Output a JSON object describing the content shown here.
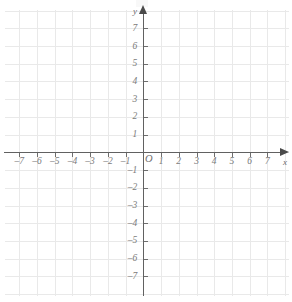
{
  "chart_data": {
    "type": "scatter",
    "title": "",
    "subtitle": "",
    "xlabel": "x",
    "ylabel": "y",
    "xlim": [
      -7.8,
      7.8
    ],
    "ylim": [
      -7.8,
      7.8
    ],
    "grid": true,
    "grid_step": 1,
    "legend": null,
    "series": [],
    "annotations": [],
    "origin_label": "O",
    "x_ticks": [
      -7,
      -6,
      -5,
      -4,
      -3,
      -2,
      -1,
      1,
      2,
      3,
      4,
      5,
      6,
      7
    ],
    "y_ticks": [
      -7,
      -6,
      -5,
      -4,
      -3,
      -2,
      -1,
      1,
      2,
      3,
      4,
      5,
      6,
      7
    ],
    "x_tick_labels": [
      "–7",
      "–6",
      "–5",
      "–4",
      "–3",
      "–2",
      "–1",
      "1",
      "2",
      "3",
      "4",
      "5",
      "6",
      "7"
    ],
    "y_tick_labels": [
      "–7",
      "–6",
      "–5",
      "–4",
      "–3",
      "–2",
      "–1",
      "1",
      "2",
      "3",
      "4",
      "5",
      "6",
      "7"
    ],
    "colors": {
      "grid": "#e9e9e9",
      "axis": "#616161",
      "tick": "#6e6e6e",
      "label": "#7b7b7b",
      "background": "#ffffff"
    }
  },
  "axes": {
    "x_name": "x",
    "y_name": "y",
    "origin": "O"
  }
}
